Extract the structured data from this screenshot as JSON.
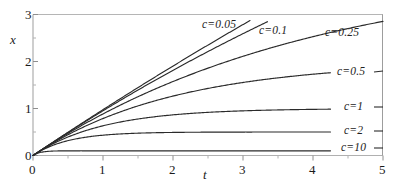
{
  "chart_data": {
    "type": "line",
    "title": "",
    "subtitle": "",
    "xlabel": "t",
    "ylabel": "x",
    "xlim": [
      0,
      5
    ],
    "ylim": [
      0,
      3
    ],
    "xticks": [
      "0",
      "1",
      "2",
      "3",
      "4",
      "5"
    ],
    "xtick_values": [
      0,
      1,
      2,
      3,
      4,
      5
    ],
    "yticks": [
      "0",
      "1",
      "2",
      "3"
    ],
    "ytick_values": [
      0,
      1,
      2,
      3
    ],
    "minor_ticks": true,
    "grid": false,
    "legend_position": "inline-right-of-curves",
    "formula": "x(t) = (1/c)(1 - e^(-c t))",
    "line_color": "#2b2b2b",
    "axis_color": "#9a9a9a",
    "series": [
      {
        "name": "c=0.05",
        "c": 0.05,
        "asymptote": 20,
        "label": "c=0.05",
        "x": [
          0,
          0.25,
          0.5,
          0.75,
          1,
          1.25,
          1.5,
          1.75,
          2,
          2.25,
          2.5,
          2.75,
          3,
          3.1
        ],
        "values": [
          0,
          0.248,
          0.494,
          0.736,
          0.975,
          1.212,
          1.445,
          1.676,
          1.903,
          2.128,
          2.35,
          2.569,
          2.786,
          2.872
        ]
      },
      {
        "name": "c=0.1",
        "c": 0.1,
        "asymptote": 10,
        "label": "c=0.1",
        "x": [
          0,
          0.25,
          0.5,
          0.75,
          1,
          1.25,
          1.5,
          1.75,
          2,
          2.25,
          2.5,
          2.75,
          3,
          3.25,
          3.35
        ],
        "values": [
          0,
          0.247,
          0.488,
          0.723,
          0.952,
          1.175,
          1.393,
          1.606,
          1.813,
          2.015,
          2.212,
          2.404,
          2.592,
          2.775,
          2.847
        ]
      },
      {
        "name": "c=0.25",
        "c": 0.25,
        "asymptote": 4,
        "label": "c=0.25",
        "x": [
          0,
          0.25,
          0.5,
          0.75,
          1,
          1.5,
          2,
          2.5,
          3,
          3.5,
          4,
          4.5,
          5
        ],
        "values": [
          0,
          0.242,
          0.472,
          0.689,
          0.885,
          1.252,
          1.574,
          1.856,
          2.11,
          2.336,
          2.528,
          2.694,
          2.855
        ]
      },
      {
        "name": "c=0.5",
        "c": 0.5,
        "asymptote": 2,
        "label": "c=0.5",
        "x": [
          0,
          0.25,
          0.5,
          0.75,
          1,
          1.5,
          2,
          2.5,
          3,
          3.5,
          4,
          4.25
        ],
        "values": [
          0,
          0.236,
          0.442,
          0.623,
          0.787,
          1.056,
          1.264,
          1.427,
          1.554,
          1.653,
          1.729,
          1.76
        ]
      },
      {
        "name": "c=1",
        "c": 1,
        "asymptote": 1,
        "label": "c=1",
        "x": [
          0,
          0.25,
          0.5,
          0.75,
          1,
          1.5,
          2,
          2.5,
          3,
          3.5,
          4,
          4.25
        ],
        "values": [
          0,
          0.221,
          0.393,
          0.528,
          0.632,
          0.777,
          0.865,
          0.918,
          0.95,
          0.97,
          0.982,
          0.986
        ]
      },
      {
        "name": "c=2",
        "c": 2,
        "asymptote": 0.5,
        "label": "c=2",
        "x": [
          0,
          0.25,
          0.5,
          0.75,
          1,
          1.5,
          2,
          2.5,
          3,
          3.5,
          4,
          4.25
        ],
        "values": [
          0,
          0.197,
          0.316,
          0.388,
          0.432,
          0.475,
          0.491,
          0.497,
          0.499,
          0.4996,
          0.4998,
          0.4999
        ]
      },
      {
        "name": "c=10",
        "c": 10,
        "asymptote": 0.1,
        "label": "c=10",
        "x": [
          0,
          0.1,
          0.25,
          0.5,
          0.75,
          1,
          1.5,
          2,
          3,
          4,
          4.25
        ],
        "values": [
          0,
          0.063,
          0.092,
          0.099,
          0.0999,
          0.1,
          0.1,
          0.1,
          0.1,
          0.1,
          0.1
        ]
      }
    ]
  },
  "axes": {
    "x_label": "t",
    "y_label": "x",
    "x_tick_labels": [
      "0",
      "1",
      "2",
      "3",
      "4",
      "5"
    ],
    "y_tick_labels": [
      "0",
      "1",
      "2",
      "3"
    ]
  },
  "curve_labels": [
    {
      "text": "c=0.05"
    },
    {
      "text": "c=0.1"
    },
    {
      "text": "c=0.25"
    },
    {
      "text": "c=0.5"
    },
    {
      "text": "c=1"
    },
    {
      "text": "c=2"
    },
    {
      "text": "c=10"
    }
  ]
}
